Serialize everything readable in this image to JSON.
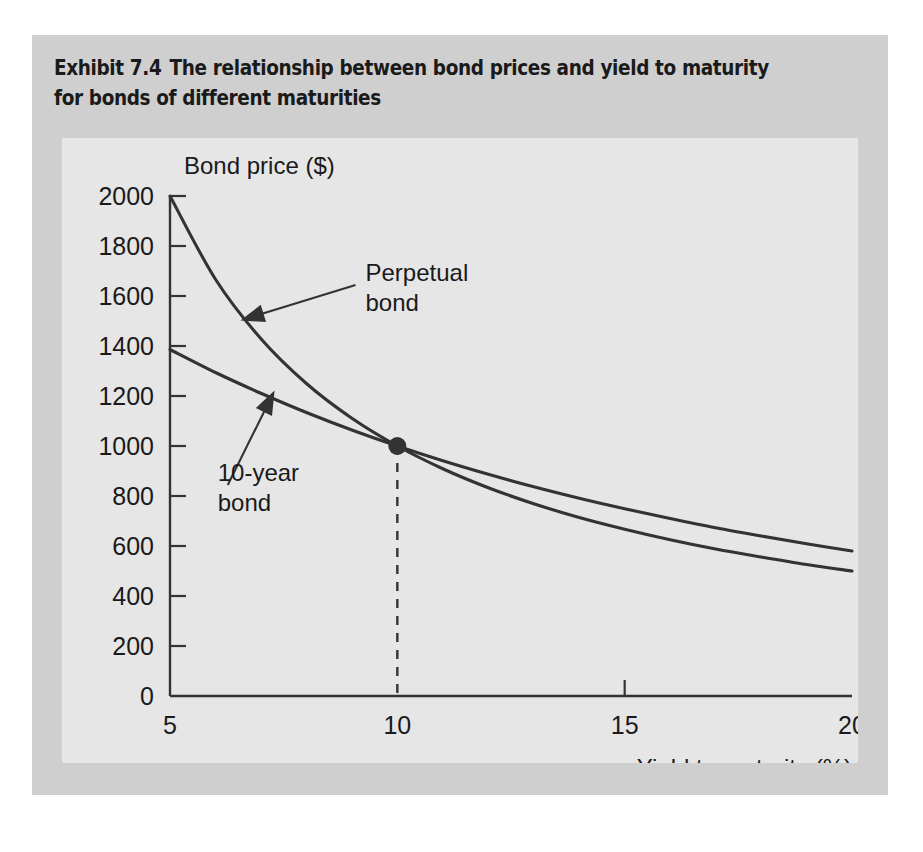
{
  "figure": {
    "exhibit_number": "Exhibit 7.4",
    "caption": "The relationship between bond prices and yield to maturity for bonds of different maturities",
    "panel_color": "#cfcfcf",
    "plot_background": "#e6e6e6",
    "ink_color": "#333333"
  },
  "chart_data": {
    "type": "line",
    "title": "The relationship between bond prices and yield to maturity for bonds of different maturities",
    "xlabel": "Yield to maturity (%)",
    "ylabel": "Bond price ($)",
    "xlim": [
      5,
      20
    ],
    "ylim": [
      0,
      2000
    ],
    "xticks": [
      5,
      10,
      15,
      20
    ],
    "yticks": [
      0,
      200,
      400,
      600,
      800,
      1000,
      1200,
      1400,
      1600,
      1800,
      2000
    ],
    "xtick_labels": [
      "5",
      "10",
      "15",
      "20"
    ],
    "ytick_labels": [
      "0",
      "200",
      "400",
      "600",
      "800",
      "1000",
      "1200",
      "1400",
      "1600",
      "1800",
      "2000"
    ],
    "grid": false,
    "legend_position": "none",
    "x": [
      5,
      6,
      7,
      8,
      9,
      10,
      11,
      12,
      13,
      14,
      15,
      16,
      17,
      18,
      19,
      20
    ],
    "series": [
      {
        "name": "Perpetual bond",
        "values": [
          2000,
          1667,
          1429,
          1250,
          1111,
          1000,
          909,
          833,
          769,
          714,
          667,
          625,
          588,
          556,
          526,
          500
        ]
      },
      {
        "name": "10-year bond",
        "values": [
          1386,
          1294,
          1211,
          1134,
          1064,
          1000,
          941,
          887,
          837,
          791,
          749,
          710,
          673,
          640,
          609,
          580
        ]
      }
    ],
    "annotations": [
      {
        "name": "perpetual-bond",
        "lines": [
          "Perpetual",
          "bond"
        ],
        "text_x": 9.3,
        "text_y": 1660,
        "arrow_tip_x": 6.55,
        "arrow_tip_y": 1502
      },
      {
        "name": "ten-year-bond",
        "lines": [
          "10-year",
          "bond"
        ],
        "text_x": 6.05,
        "text_y": 860,
        "arrow_tip_x": 7.3,
        "arrow_tip_y": 1222
      }
    ],
    "markers": [
      {
        "name": "intersection-point",
        "x": 10,
        "y": 1000,
        "label": "",
        "drop_line": true
      }
    ]
  }
}
